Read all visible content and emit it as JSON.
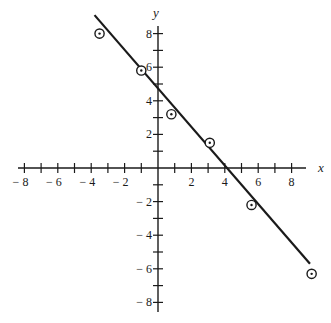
{
  "chart_data": {
    "type": "scatter",
    "title": "",
    "xlabel": "x",
    "ylabel": "y",
    "xlim": [
      -8,
      9
    ],
    "ylim": [
      -8.5,
      8.5
    ],
    "grid": false,
    "legend": null,
    "x_ticks": [
      -8,
      -7,
      -6,
      -5,
      -4,
      -3,
      -2,
      -1,
      1,
      2,
      3,
      4,
      5,
      6,
      7,
      8
    ],
    "x_tick_labels": [
      "− 8",
      "− 6",
      "− 4",
      "− 2",
      "2",
      "4",
      "6",
      "8"
    ],
    "x_tick_label_values": [
      -8,
      -6,
      -4,
      -2,
      2,
      4,
      6,
      8
    ],
    "y_ticks": [
      -8,
      -7,
      -6,
      -5,
      -4,
      -3,
      -2,
      -1,
      1,
      2,
      3,
      4,
      5,
      6,
      7,
      8
    ],
    "y_tick_labels": [
      "8",
      "6",
      "4",
      "2",
      "− 2",
      "− 4",
      "− 6",
      "− 8"
    ],
    "y_tick_label_values": [
      8,
      6,
      4,
      2,
      -2,
      -4,
      -6,
      -8
    ],
    "series": [
      {
        "name": "data points",
        "marker": "circled-dot",
        "points": [
          {
            "x": -3.5,
            "y": 8.0
          },
          {
            "x": -1.0,
            "y": 5.8
          },
          {
            "x": 0.8,
            "y": 3.2
          },
          {
            "x": 3.1,
            "y": 1.5
          },
          {
            "x": 5.6,
            "y": -2.2
          },
          {
            "x": 9.2,
            "y": -6.3
          }
        ]
      },
      {
        "name": "fitted line",
        "type": "line",
        "points": [
          {
            "x": -3.8,
            "y": 9.1
          },
          {
            "x": 9.1,
            "y": -5.7
          }
        ],
        "slope": -1.15,
        "intercept": 4.6
      }
    ]
  }
}
